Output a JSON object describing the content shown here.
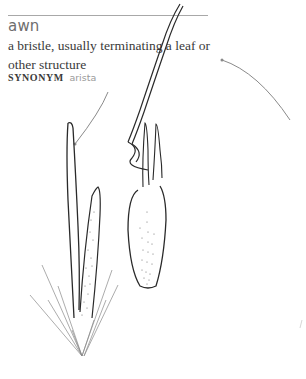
{
  "entry": {
    "term": "awn",
    "definition": "a bristle, usually terminating a leaf or other structure",
    "synonym_label": "SYNONYM",
    "synonym_value": "arista"
  },
  "illustration": {
    "subject": "grass spikelets with awns",
    "callout_color": "#8a8a8a",
    "line_color": "#2a2a2a"
  }
}
